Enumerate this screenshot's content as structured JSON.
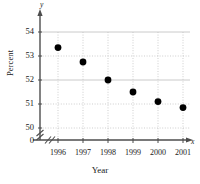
{
  "chart_data": {
    "type": "scatter",
    "title": "",
    "xlabel": "Year",
    "ylabel": "Percent",
    "categories": [
      "1996",
      "1997",
      "1998",
      "1999",
      "2000",
      "2001"
    ],
    "x": [
      1996,
      1997,
      1998,
      1999,
      2000,
      2001
    ],
    "values": [
      53.35,
      52.75,
      52.0,
      51.5,
      51.1,
      50.85
    ],
    "series": [
      {
        "name": "Percent",
        "values": [
          53.35,
          52.75,
          52.0,
          51.5,
          51.1,
          50.85
        ]
      }
    ],
    "ylim": [
      50,
      54
    ],
    "xlim": [
      1995.5,
      2001.5
    ],
    "ytick_labels": [
      "54",
      "53",
      "52",
      "51",
      "50"
    ],
    "ytick_values": [
      54,
      53,
      52,
      51,
      50
    ],
    "xtick_labels": [
      "1996",
      "1997",
      "1998",
      "1999",
      "2000",
      "2001"
    ],
    "origin_label": "0",
    "axis_break": true,
    "grid": true,
    "legend": null,
    "marker": "filled-circle",
    "marker_color": "#000000",
    "grid_color": "#c9c9c9",
    "axis_color": "#555555",
    "axis_letter_x": "x",
    "axis_letter_y": "y"
  }
}
